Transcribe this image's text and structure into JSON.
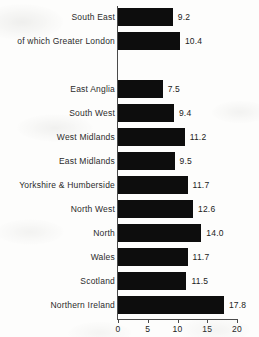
{
  "chart_data": {
    "type": "bar",
    "orientation": "horizontal",
    "title": "",
    "subtitle": "",
    "xlabel": "",
    "ylabel": "",
    "xlim": [
      0,
      20
    ],
    "xticks": [
      "0",
      "5",
      "10",
      "15",
      "20"
    ],
    "grid": false,
    "legend": null,
    "bar_color": "#0d0d0d",
    "axis_color": "#4a4a4a",
    "categories": [
      "South East",
      "of which Greater London",
      "",
      "East Anglia",
      "South West",
      "West Midlands",
      "East Midlands",
      "Yorkshire & Humberside",
      "North West",
      "North",
      "Wales",
      "Scotland",
      "Northern Ireland"
    ],
    "values": [
      9.2,
      10.4,
      null,
      7.5,
      9.4,
      11.2,
      9.5,
      11.7,
      12.6,
      14.0,
      11.7,
      11.5,
      17.8
    ],
    "value_labels": [
      "9.2",
      "10.4",
      "",
      "7.5",
      "9.4",
      "11.2",
      "9.5",
      "11.7",
      "12.6",
      "14.0",
      "11.7",
      "11.5",
      "17.8"
    ],
    "bars": [
      {
        "category": "South East",
        "value": 9.2,
        "label": "9.2"
      },
      {
        "category": "of which Greater London",
        "value": 10.4,
        "label": "10.4"
      },
      {
        "category": "",
        "value": null,
        "label": ""
      },
      {
        "category": "East Anglia",
        "value": 7.5,
        "label": "7.5"
      },
      {
        "category": "South West",
        "value": 9.4,
        "label": "9.4"
      },
      {
        "category": "West Midlands",
        "value": 11.2,
        "label": "11.2"
      },
      {
        "category": "East Midlands",
        "value": 9.5,
        "label": "9.5"
      },
      {
        "category": "Yorkshire & Humberside",
        "value": 11.7,
        "label": "11.7"
      },
      {
        "category": "North West",
        "value": 12.6,
        "label": "12.6"
      },
      {
        "category": "North",
        "value": 14.0,
        "label": "14.0"
      },
      {
        "category": "Wales",
        "value": 11.7,
        "label": "11.7"
      },
      {
        "category": "Scotland",
        "value": 11.5,
        "label": "11.5"
      },
      {
        "category": "Northern Ireland",
        "value": 17.8,
        "label": "17.8"
      }
    ]
  }
}
